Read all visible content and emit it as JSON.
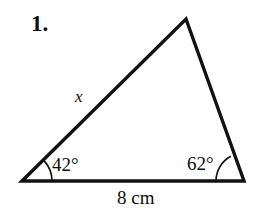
{
  "figure": {
    "type": "geometry-diagram",
    "background_color": "#ffffff",
    "stroke_color": "#111111",
    "problem_number": "1.",
    "side_label_x": "x",
    "base_label": "8 cm",
    "angle_left": "42°",
    "angle_right": "62°",
    "vertices": {
      "bottom_left": [
        22,
        181
      ],
      "bottom_right": [
        244,
        181
      ],
      "apex": [
        186,
        19
      ]
    },
    "measurements": {
      "base_length_value": 8,
      "base_length_unit": "cm",
      "angle_left_degrees": 42,
      "angle_right_degrees": 62,
      "unknown_side": "x"
    },
    "arcs": {
      "left_radius": 30,
      "right_radius": 28
    }
  }
}
